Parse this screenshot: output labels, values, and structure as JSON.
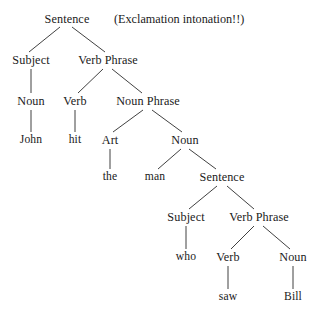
{
  "figure": {
    "name": "syntax-tree-diagram",
    "background_color": "#ffffff",
    "text_color": "#1a1a1a",
    "edge_color": "#2b2b2b"
  },
  "annotation": {
    "text": "(Exclamation intonation!!)",
    "x": 114,
    "y": 19
  },
  "nodes": [
    {
      "id": "s-root",
      "label": "Sentence",
      "x": 67,
      "y": 19,
      "kind": "nonterminal"
    },
    {
      "id": "subject-1",
      "label": "Subject",
      "x": 31,
      "y": 60,
      "kind": "nonterminal"
    },
    {
      "id": "vp-1",
      "label": "Verb Phrase",
      "x": 108,
      "y": 60,
      "kind": "nonterminal"
    },
    {
      "id": "noun-1",
      "label": "Noun",
      "x": 31,
      "y": 101,
      "kind": "nonterminal"
    },
    {
      "id": "verb-1",
      "label": "Verb",
      "x": 75,
      "y": 101,
      "kind": "nonterminal"
    },
    {
      "id": "np-1",
      "label": "Noun Phrase",
      "x": 148,
      "y": 101,
      "kind": "nonterminal"
    },
    {
      "id": "john",
      "label": "John",
      "x": 31,
      "y": 140,
      "kind": "terminal"
    },
    {
      "id": "hit",
      "label": "hit",
      "x": 75,
      "y": 140,
      "kind": "terminal"
    },
    {
      "id": "art-1",
      "label": "Art",
      "x": 110,
      "y": 140,
      "kind": "nonterminal"
    },
    {
      "id": "noun-2",
      "label": "Noun",
      "x": 185,
      "y": 140,
      "kind": "nonterminal"
    },
    {
      "id": "the",
      "label": "the",
      "x": 110,
      "y": 177,
      "kind": "terminal"
    },
    {
      "id": "man",
      "label": "man",
      "x": 155,
      "y": 177,
      "kind": "terminal"
    },
    {
      "id": "s-embedded",
      "label": "Sentence",
      "x": 222,
      "y": 177,
      "kind": "nonterminal"
    },
    {
      "id": "subject-2",
      "label": "Subject",
      "x": 186,
      "y": 217,
      "kind": "nonterminal"
    },
    {
      "id": "vp-2",
      "label": "Verb Phrase",
      "x": 259,
      "y": 217,
      "kind": "nonterminal"
    },
    {
      "id": "who",
      "label": "who",
      "x": 186,
      "y": 257,
      "kind": "terminal"
    },
    {
      "id": "verb-2",
      "label": "Verb",
      "x": 228,
      "y": 257,
      "kind": "nonterminal"
    },
    {
      "id": "noun-3",
      "label": "Noun",
      "x": 293,
      "y": 257,
      "kind": "nonterminal"
    },
    {
      "id": "saw",
      "label": "saw",
      "x": 228,
      "y": 297,
      "kind": "terminal"
    },
    {
      "id": "bill",
      "label": "Bill",
      "x": 293,
      "y": 297,
      "kind": "terminal"
    }
  ],
  "edges": [
    {
      "from": "s-root",
      "to": "subject-1",
      "x1": 60,
      "y1": 27,
      "x2": 29,
      "y2": 52
    },
    {
      "from": "s-root",
      "to": "vp-1",
      "x1": 72,
      "y1": 27,
      "x2": 105,
      "y2": 52
    },
    {
      "from": "subject-1",
      "to": "noun-1",
      "x1": 31,
      "y1": 69,
      "x2": 31,
      "y2": 93
    },
    {
      "from": "vp-1",
      "to": "verb-1",
      "x1": 103,
      "y1": 69,
      "x2": 78,
      "y2": 93
    },
    {
      "from": "vp-1",
      "to": "np-1",
      "x1": 112,
      "y1": 69,
      "x2": 142,
      "y2": 93
    },
    {
      "from": "noun-1",
      "to": "john",
      "x1": 31,
      "y1": 110,
      "x2": 31,
      "y2": 132
    },
    {
      "from": "verb-1",
      "to": "hit",
      "x1": 75,
      "y1": 110,
      "x2": 75,
      "y2": 132
    },
    {
      "from": "np-1",
      "to": "art-1",
      "x1": 143,
      "y1": 110,
      "x2": 113,
      "y2": 132
    },
    {
      "from": "np-1",
      "to": "noun-2",
      "x1": 152,
      "y1": 110,
      "x2": 182,
      "y2": 132
    },
    {
      "from": "art-1",
      "to": "the",
      "x1": 110,
      "y1": 149,
      "x2": 110,
      "y2": 169
    },
    {
      "from": "noun-2",
      "to": "man",
      "x1": 181,
      "y1": 149,
      "x2": 158,
      "y2": 169
    },
    {
      "from": "noun-2",
      "to": "s-embedded",
      "x1": 189,
      "y1": 149,
      "x2": 216,
      "y2": 169
    },
    {
      "from": "s-embedded",
      "to": "subject-2",
      "x1": 217,
      "y1": 186,
      "x2": 189,
      "y2": 209
    },
    {
      "from": "s-embedded",
      "to": "vp-2",
      "x1": 227,
      "y1": 186,
      "x2": 254,
      "y2": 209
    },
    {
      "from": "subject-2",
      "to": "who",
      "x1": 186,
      "y1": 226,
      "x2": 186,
      "y2": 249
    },
    {
      "from": "vp-2",
      "to": "verb-2",
      "x1": 254,
      "y1": 226,
      "x2": 231,
      "y2": 249
    },
    {
      "from": "vp-2",
      "to": "noun-3",
      "x1": 263,
      "y1": 226,
      "x2": 290,
      "y2": 249
    },
    {
      "from": "verb-2",
      "to": "saw",
      "x1": 228,
      "y1": 266,
      "x2": 228,
      "y2": 289
    },
    {
      "from": "noun-3",
      "to": "bill",
      "x1": 293,
      "y1": 266,
      "x2": 293,
      "y2": 289
    }
  ]
}
